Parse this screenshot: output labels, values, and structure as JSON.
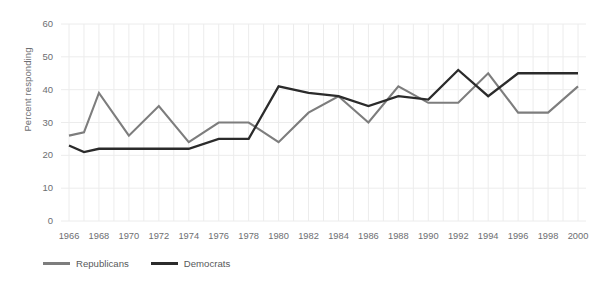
{
  "chart_data": {
    "type": "line",
    "title": "",
    "subtitle": "",
    "xlabel": "",
    "ylabel": "Percent responding",
    "xlim": [
      1966,
      2000
    ],
    "ylim": [
      0,
      60
    ],
    "y_ticks": [
      0,
      10,
      20,
      30,
      40,
      50,
      60
    ],
    "x_ticks": [
      1966,
      1968,
      1970,
      1972,
      1974,
      1976,
      1978,
      1980,
      1982,
      1984,
      1986,
      1988,
      1990,
      1992,
      1994,
      1996,
      1998,
      2000
    ],
    "grid": true,
    "grid_orientation": "both",
    "legend_position": "bottom-left",
    "x": [
      1966,
      1967,
      1968,
      1970,
      1972,
      1974,
      1976,
      1978,
      1980,
      1982,
      1984,
      1986,
      1988,
      1990,
      1992,
      1994,
      1996,
      1998,
      2000
    ],
    "series": [
      {
        "name": "Republicans",
        "color": "#7d7d7d",
        "values": [
          26,
          27,
          39,
          26,
          35,
          24,
          30,
          30,
          24,
          33,
          38,
          30,
          41,
          36,
          36,
          45,
          33,
          33,
          41
        ]
      },
      {
        "name": "Democrats",
        "color": "#2b2b2b",
        "values": [
          23,
          21,
          22,
          22,
          22,
          22,
          25,
          25,
          41,
          39,
          38,
          35,
          38,
          37,
          46,
          38,
          45,
          45,
          45
        ]
      }
    ],
    "annotations": []
  },
  "axis": {
    "y_title": "Percent responding",
    "y_tick_labels": [
      "0",
      "10",
      "20",
      "30",
      "40",
      "50",
      "60"
    ],
    "x_tick_labels": [
      "1966",
      "1968",
      "1970",
      "1972",
      "1974",
      "1976",
      "1978",
      "1980",
      "1982",
      "1984",
      "1986",
      "1988",
      "1990",
      "1992",
      "1994",
      "1996",
      "1998",
      "2000"
    ]
  },
  "legend": {
    "items": [
      {
        "label": "Republicans",
        "color": "#7d7d7d"
      },
      {
        "label": "Democrats",
        "color": "#2b2b2b"
      }
    ]
  },
  "colors": {
    "republicans": "#7d7d7d",
    "democrats": "#2b2b2b",
    "grid": "#ececec",
    "text": "#6d6e71",
    "background": "#ffffff"
  }
}
